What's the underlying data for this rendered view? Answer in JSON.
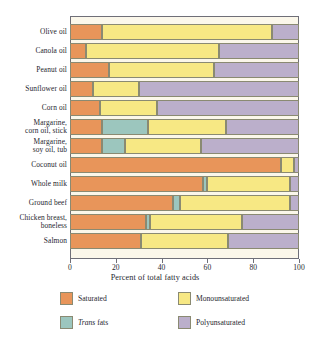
{
  "chart_data": {
    "type": "bar",
    "orientation": "horizontal",
    "stacked": true,
    "title": "",
    "xlabel": "Percent of total fatty acids",
    "ylabel": "",
    "xlim": [
      0,
      100
    ],
    "xticks": [
      0,
      20,
      40,
      60,
      80,
      100
    ],
    "grid": false,
    "legend_position": "bottom",
    "categories": [
      "Olive oil",
      "Canola oil",
      "Peanut oil",
      "Sunflower oil",
      "Corn oil",
      "Margarine,\ncorn oil, stick",
      "Margarine,\nsoy oil, tub",
      "Coconut oil",
      "Whole milk",
      "Ground beef",
      "Chicken breast,\nboneless",
      "Salmon"
    ],
    "series": [
      {
        "name": "Saturated",
        "color": "#e8955a",
        "values": [
          14,
          7,
          17,
          10,
          13,
          14,
          14,
          92,
          58,
          45,
          33,
          31
        ]
      },
      {
        "name": "Trans fats",
        "color": "#9cc6be",
        "values": [
          0,
          0,
          0,
          0,
          0,
          20,
          10,
          0,
          2,
          3,
          2,
          0
        ]
      },
      {
        "name": "Monounsaturated",
        "color": "#f7e884",
        "values": [
          74,
          58,
          46,
          20,
          25,
          34,
          33,
          6,
          36,
          48,
          40,
          38
        ]
      },
      {
        "name": "Polyunsaturated",
        "color": "#bbafcb",
        "values": [
          12,
          35,
          37,
          70,
          62,
          32,
          43,
          2,
          4,
          4,
          25,
          31
        ]
      }
    ],
    "legend": [
      {
        "label": "Saturated",
        "color": "#e8955a",
        "italic_prefix": ""
      },
      {
        "label": "Monounsaturated",
        "color": "#f7e884",
        "italic_prefix": ""
      },
      {
        "label": "fats",
        "color": "#9cc6be",
        "italic_prefix": "Trans"
      },
      {
        "label": "Polyunsaturated",
        "color": "#bbafcb",
        "italic_prefix": ""
      }
    ]
  }
}
